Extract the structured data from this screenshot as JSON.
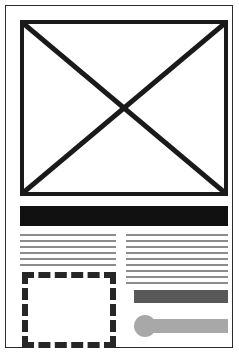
{
  "page": {
    "width": 239,
    "height": 353,
    "background_color": "#ffffff",
    "frame_color": "#2b2b2b"
  },
  "image_placeholder": {
    "name": "image-placeholder",
    "border_color": "#1a1a1a",
    "border_width": 4,
    "cross_color": "#1a1a1a",
    "fill_color": "#ffffff"
  },
  "header_band": {
    "name": "header-band",
    "color": "#111111"
  },
  "columns": {
    "left": {
      "name": "left-text-column",
      "line_color": "#8c8c8c",
      "lines": [
        1,
        2,
        3,
        4,
        5,
        6
      ]
    },
    "right": {
      "name": "right-text-column",
      "line_color": "#8c8c8c",
      "lines": [
        1,
        2,
        3,
        4,
        5,
        6,
        7,
        8,
        9
      ]
    }
  },
  "dashed_box": {
    "name": "dashed-placeholder-box",
    "border_color": "#262626",
    "border_style": "dashed",
    "border_width": 6
  },
  "dark_bar": {
    "name": "dark-bar",
    "color": "#595959"
  },
  "slider": {
    "name": "slider-control",
    "track_color": "#a8a8a8",
    "knob_color": "#a8a8a8",
    "knob_position": "left"
  }
}
